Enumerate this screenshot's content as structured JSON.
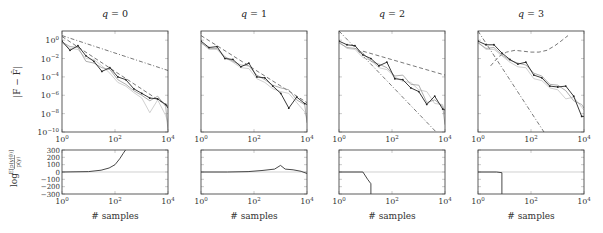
{
  "figure": {
    "ylabel_top": "|F − F̂|",
    "ylabel_bottom": "log E[p(y|θ)] / p(y)",
    "ylabel_bottom_num": "E[p(y|θ)]",
    "ylabel_bottom_den": "p(y)",
    "ylabel_bottom_prefix": "log",
    "xlabel": "# samples"
  },
  "chart_data": [
    {
      "type": "line",
      "title": "q = 0",
      "title_q": "q",
      "title_val": "0",
      "xlabel": "# samples",
      "ylabel": "|F − F̂|",
      "xscale": "log",
      "yscale": "log",
      "xlim": [
        1,
        10000
      ],
      "ylim_exp": [
        -10,
        1
      ],
      "x_ticks": [
        "10^0",
        "10^2",
        "10^4"
      ],
      "y_ticks": [
        "10^0",
        "10^-2",
        "10^-4",
        "10^-6",
        "10^-8",
        "10^-10"
      ],
      "x": [
        1,
        2,
        4,
        8,
        16,
        32,
        64,
        128,
        256,
        512,
        1024,
        2048,
        4096,
        8192,
        10000
      ],
      "series": [
        {
          "name": "estimate (dark, markers)",
          "style": "solid-dark-marker",
          "log10_y": [
            -0.1,
            -1.1,
            -0.6,
            -1.7,
            -2.3,
            -3.4,
            -3.0,
            -4.0,
            -4.3,
            -5.3,
            -5.8,
            -6.3,
            -6.4,
            -7.0,
            -7.4
          ]
        },
        {
          "name": "estimate (gray 1)",
          "style": "solid-gray",
          "log10_y": [
            -0.2,
            -0.7,
            -0.8,
            -2.3,
            -2.5,
            -3.0,
            -3.2,
            -4.3,
            -4.8,
            -5.5,
            -6.0,
            -6.6,
            -6.1,
            -7.2,
            -9.8
          ]
        },
        {
          "name": "estimate (gray 2)",
          "style": "solid-lightgray",
          "log10_y": [
            -0.3,
            -0.9,
            -1.0,
            -2.0,
            -2.1,
            -2.8,
            -3.6,
            -4.6,
            -5.0,
            -5.7,
            -6.3,
            -7.9,
            -6.5,
            -8.2,
            -9.0
          ]
        },
        {
          "name": "reference slope (dashed)",
          "style": "dashed",
          "log10_y_endpoints": [
            0.4,
            -7.2
          ]
        },
        {
          "name": "reference slope (dash-dot)",
          "style": "dashdot",
          "log10_y_endpoints": [
            0.5,
            -3.3
          ]
        }
      ],
      "lower": {
        "type": "line",
        "ylabel": "log E[p(y|θ)]/p(y)",
        "ylim": [
          -300,
          300
        ],
        "y_ticks": [
          300,
          200,
          100,
          0,
          -100,
          -200,
          -300
        ],
        "x_ticks": [
          "10^0",
          "10^2",
          "10^4"
        ],
        "reference_line": 0,
        "x": [
          1,
          10,
          30,
          60,
          100,
          150,
          200,
          250
        ],
        "values": [
          0,
          5,
          25,
          55,
          100,
          180,
          250,
          300
        ]
      }
    },
    {
      "type": "line",
      "title": "q = 1",
      "title_q": "q",
      "title_val": "1",
      "xlabel": "# samples",
      "xscale": "log",
      "yscale": "log",
      "xlim": [
        1,
        10000
      ],
      "ylim_exp": [
        -10,
        1
      ],
      "x_ticks": [
        "10^0",
        "10^2",
        "10^4"
      ],
      "x": [
        1,
        2,
        4,
        8,
        16,
        32,
        64,
        128,
        256,
        512,
        1024,
        2048,
        4096,
        8192,
        10000
      ],
      "series": [
        {
          "name": "estimate (dark, markers)",
          "style": "solid-dark-marker",
          "log10_y": [
            -0.1,
            -0.8,
            -0.7,
            -2.0,
            -2.1,
            -2.9,
            -2.5,
            -4.0,
            -4.1,
            -5.0,
            -5.8,
            -7.4,
            -6.2,
            -6.9,
            -7.0
          ]
        },
        {
          "name": "estimate (gray 1)",
          "style": "solid-gray",
          "log10_y": [
            -0.3,
            -0.9,
            -0.9,
            -1.8,
            -2.3,
            -2.7,
            -2.8,
            -3.8,
            -4.3,
            -4.9,
            -5.2,
            -5.4,
            -6.5,
            -7.0,
            -9.0
          ]
        },
        {
          "name": "estimate (gray 2)",
          "style": "solid-lightgray",
          "log10_y": [
            -0.2,
            -1.0,
            -1.0,
            -1.9,
            -2.4,
            -3.0,
            -3.1,
            -4.2,
            -4.6,
            -5.3,
            -5.6,
            -5.8,
            -6.8,
            -7.8,
            -8.5
          ]
        },
        {
          "name": "reference slope (dashed)",
          "style": "dashed",
          "log10_y_endpoints": [
            0.5,
            -6.8
          ]
        }
      ],
      "lower": {
        "type": "line",
        "ylim": [
          -300,
          300
        ],
        "x_ticks": [
          "10^0",
          "10^2",
          "10^4"
        ],
        "reference_line": 0,
        "x": [
          1,
          10,
          60,
          200,
          600,
          1000,
          1500,
          3000,
          6000,
          10000
        ],
        "values": [
          0,
          0,
          5,
          20,
          40,
          90,
          40,
          30,
          10,
          -20
        ]
      }
    },
    {
      "type": "line",
      "title": "q = 2",
      "title_q": "q",
      "title_val": "2",
      "xlabel": "# samples",
      "xscale": "log",
      "yscale": "log",
      "xlim": [
        1,
        10000
      ],
      "ylim_exp": [
        -10,
        1
      ],
      "x_ticks": [
        "10^0",
        "10^2",
        "10^4"
      ],
      "x": [
        1,
        2,
        4,
        8,
        16,
        32,
        64,
        128,
        256,
        512,
        1024,
        2048,
        4096,
        8192,
        10000
      ],
      "series": [
        {
          "name": "estimate (dark, markers)",
          "style": "solid-dark-marker",
          "log10_y": [
            -0.1,
            -0.5,
            -0.6,
            -1.6,
            -2.0,
            -2.8,
            -2.4,
            -4.2,
            -4.3,
            -5.2,
            -5.6,
            -7.0,
            -6.1,
            -7.5,
            -7.6
          ]
        },
        {
          "name": "estimate (gray 1)",
          "style": "solid-gray",
          "log10_y": [
            -0.3,
            -0.8,
            -0.9,
            -1.4,
            -2.3,
            -2.6,
            -3.0,
            -3.9,
            -3.8,
            -4.8,
            -4.9,
            -6.8,
            -6.5,
            -7.2,
            -9.2
          ]
        },
        {
          "name": "estimate (gray 2)",
          "style": "solid-lightgray",
          "log10_y": [
            -0.2,
            -0.9,
            -1.0,
            -1.9,
            -2.2,
            -3.0,
            -3.2,
            -4.0,
            -4.5,
            -4.6,
            -5.4,
            -5.6,
            -6.9,
            -7.0,
            -8.1
          ]
        },
        {
          "name": "reference slope (dashed, shallow)",
          "style": "dashed",
          "log10_y_endpoints_from_x": [
            8,
            -1.2
          ],
          "log10_y_end": -3.8
        },
        {
          "name": "reference slope (dash-dot, steep)",
          "style": "dashdot",
          "log10_y_endpoints": [
            1.0,
            -11.0
          ]
        }
      ],
      "lower": {
        "type": "line",
        "ylim": [
          -300,
          300
        ],
        "x_ticks": [
          "10^0",
          "10^2",
          "10^4"
        ],
        "reference_line": 0,
        "x": [
          1,
          8,
          12,
          16,
          16
        ],
        "values": [
          0,
          0,
          -100,
          -160,
          -300
        ]
      }
    },
    {
      "type": "line",
      "title": "q = 3",
      "title_q": "q",
      "title_val": "3",
      "xlabel": "# samples",
      "xscale": "log",
      "yscale": "log",
      "xlim": [
        1,
        10000
      ],
      "ylim_exp": [
        -10,
        1
      ],
      "x_ticks": [
        "10^0",
        "10^2",
        "10^4"
      ],
      "x": [
        1,
        2,
        4,
        8,
        16,
        32,
        64,
        128,
        256,
        512,
        1024,
        2048,
        4096,
        8192,
        10000
      ],
      "series": [
        {
          "name": "estimate (dark, markers)",
          "style": "solid-dark-marker",
          "log10_y": [
            -0.1,
            -0.5,
            -0.5,
            -1.4,
            -2.1,
            -2.6,
            -2.4,
            -3.8,
            -4.1,
            -5.0,
            -5.1,
            -5.0,
            -6.1,
            -8.3,
            -8.3
          ]
        },
        {
          "name": "estimate (gray 1)",
          "style": "solid-gray",
          "log10_y": [
            -0.3,
            -0.9,
            -0.8,
            -1.6,
            -2.2,
            -2.5,
            -2.7,
            -3.6,
            -3.9,
            -4.8,
            -4.9,
            -5.5,
            -6.6,
            -7.0,
            -7.4
          ]
        },
        {
          "name": "estimate (gray 2)",
          "style": "solid-lightgray",
          "log10_y": [
            -0.2,
            -1.0,
            -1.0,
            -1.7,
            -2.4,
            -2.9,
            -3.0,
            -4.2,
            -4.4,
            -5.2,
            -5.4,
            -6.4,
            -6.2,
            -7.3,
            -7.6
          ]
        },
        {
          "name": "reference (dashed, U-shaped)",
          "style": "dashed",
          "x_curve": [
            3,
            6,
            12,
            25,
            50,
            100,
            200,
            400,
            800,
            1500,
            2500
          ],
          "log10_y_curve": [
            -2.8,
            -1.8,
            -1.3,
            -1.1,
            -1.2,
            -1.3,
            -1.3,
            -1.1,
            -0.6,
            0.0,
            0.5
          ]
        },
        {
          "name": "reference slope (dash-dot, steep)",
          "style": "dashdot",
          "log10_y_endpoints": [
            1.0,
            -10.5
          ],
          "x_end": 400
        }
      ],
      "lower": {
        "type": "line",
        "ylim": [
          -300,
          300
        ],
        "x_ticks": [
          "10^0",
          "10^2",
          "10^4"
        ],
        "reference_line": 0,
        "x": [
          1,
          5,
          8,
          8
        ],
        "values": [
          0,
          0,
          -10,
          -300
        ]
      }
    }
  ]
}
